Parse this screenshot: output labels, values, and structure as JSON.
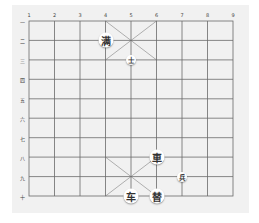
{
  "board": {
    "columns": [
      "1",
      "2",
      "3",
      "4",
      "5",
      "6",
      "7",
      "8",
      "9"
    ],
    "rows": [
      "一",
      "二",
      "三",
      "四",
      "五",
      "六",
      "七",
      "八",
      "九",
      "十"
    ],
    "line_color": "#6a6a6a",
    "background": "#f1f1f1"
  },
  "pieces": [
    {
      "label": "满",
      "col": 4,
      "row": 2,
      "size": "big"
    },
    {
      "label": "士",
      "col": 5,
      "row": 3,
      "size": "small"
    },
    {
      "label": "車",
      "col": 6,
      "row": 8,
      "size": "big"
    },
    {
      "label": "兵",
      "col": 7,
      "row": 9,
      "size": "small"
    },
    {
      "label": "车",
      "col": 5,
      "row": 10,
      "size": "big"
    },
    {
      "label": "替",
      "col": 6,
      "row": 10,
      "size": "big"
    }
  ]
}
